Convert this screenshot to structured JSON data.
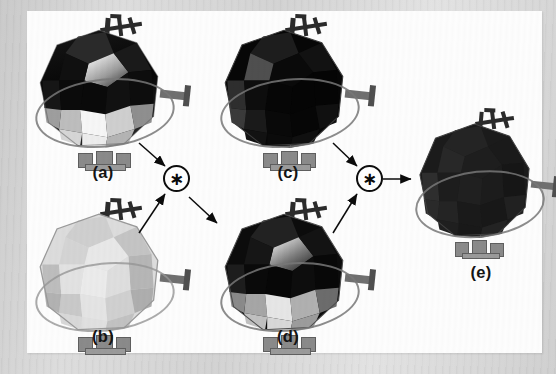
{
  "figure": {
    "kind": "scientific-figure",
    "background_color": "#d8d8d8",
    "plate_color": "#fdfdfd"
  },
  "panels": [
    {
      "id": "a",
      "label": "(a)",
      "role": "input-image-left-top",
      "appearance": "dark faceted geodesic satellite with bright specular lower facets",
      "body_tone": "#121212",
      "highlight_tone": "#f2f2f2"
    },
    {
      "id": "b",
      "label": "(b)",
      "role": "input-kernel-left-bottom",
      "appearance": "uniformly light gray faceted geodesic satellite",
      "body_tone": "#d2d2d2",
      "highlight_tone": "#efefef"
    },
    {
      "id": "c",
      "label": "(c)",
      "role": "input-image-middle-top",
      "appearance": "near-black faceted geodesic satellite, flat shading",
      "body_tone": "#080808",
      "highlight_tone": "#5a5a5a"
    },
    {
      "id": "d",
      "label": "(d)",
      "role": "result-middle-bottom",
      "appearance": "dark faceted geodesic satellite with gradient shading",
      "body_tone": "#101010",
      "highlight_tone": "#d9d9d9"
    },
    {
      "id": "e",
      "label": "(e)",
      "role": "final-result-right",
      "appearance": "dark noisy faceted geodesic satellite",
      "body_tone": "#1b1b1b",
      "highlight_tone": "#3a3a3a"
    }
  ],
  "operators": [
    {
      "id": "op1",
      "symbol": "∗",
      "icon": "convolution-asterisk-icon",
      "name": "convolution-operator-1",
      "inputs": [
        "a",
        "b"
      ],
      "output": "d"
    },
    {
      "id": "op2",
      "symbol": "∗",
      "icon": "convolution-asterisk-icon",
      "name": "convolution-operator-2",
      "inputs": [
        "c",
        "d"
      ],
      "output": "e"
    }
  ],
  "arrows": [
    {
      "name": "arrow-a-to-op1",
      "from": "a",
      "to": "op1"
    },
    {
      "name": "arrow-b-to-op1",
      "from": "b",
      "to": "op1"
    },
    {
      "name": "arrow-op1-to-d",
      "from": "op1",
      "to": "d"
    },
    {
      "name": "arrow-c-to-op2",
      "from": "c",
      "to": "op2"
    },
    {
      "name": "arrow-d-to-op2",
      "from": "d",
      "to": "op2"
    },
    {
      "name": "arrow-op2-to-e",
      "from": "op2",
      "to": "e"
    }
  ]
}
